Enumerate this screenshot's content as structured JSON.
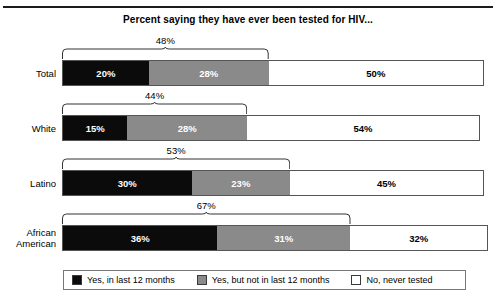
{
  "chart_data": {
    "type": "bar",
    "subtype": "stacked-horizontal-100pct",
    "title": "Percent saying they have ever been tested for HIV...",
    "xlabel": "",
    "ylabel": "",
    "xlim": [
      0,
      100
    ],
    "grid": false,
    "legend_position": "bottom",
    "categories": [
      "Total",
      "White",
      "Latino",
      "African American"
    ],
    "series": [
      {
        "name": "Yes, in last 12 months",
        "color": "#0b0b0b",
        "values": [
          20,
          15,
          30,
          36
        ]
      },
      {
        "name": "Yes, but not in last 12 months",
        "color": "#8a8a8a",
        "values": [
          28,
          28,
          23,
          31
        ]
      },
      {
        "name": "No, never tested",
        "color": "#ffffff",
        "values": [
          50,
          54,
          45,
          32
        ]
      }
    ],
    "annotations": [
      {
        "category": "Total",
        "label": "48%",
        "spans": [
          "Yes, in last 12 months",
          "Yes, but not in last 12 months"
        ]
      },
      {
        "category": "White",
        "label": "44%",
        "spans": [
          "Yes, in last 12 months",
          "Yes, but not in last 12 months"
        ]
      },
      {
        "category": "Latino",
        "label": "53%",
        "spans": [
          "Yes, in last 12 months",
          "Yes, but not in last 12 months"
        ]
      },
      {
        "category": "African American",
        "label": "67%",
        "spans": [
          "Yes, in last 12 months",
          "Yes, but not in last 12 months"
        ]
      }
    ]
  },
  "rows": [
    {
      "label_line1": "Total",
      "label_line2": "",
      "brace": "48%",
      "segments": [
        {
          "value": "20%",
          "pct": 20
        },
        {
          "value": "28%",
          "pct": 28
        },
        {
          "value": "50%",
          "pct": 50
        }
      ]
    },
    {
      "label_line1": "White",
      "label_line2": "",
      "brace": "44%",
      "segments": [
        {
          "value": "15%",
          "pct": 15
        },
        {
          "value": "28%",
          "pct": 28
        },
        {
          "value": "54%",
          "pct": 54
        }
      ]
    },
    {
      "label_line1": "Latino",
      "label_line2": "",
      "brace": "53%",
      "segments": [
        {
          "value": "30%",
          "pct": 30
        },
        {
          "value": "23%",
          "pct": 23
        },
        {
          "value": "45%",
          "pct": 45
        }
      ]
    },
    {
      "label_line1": "African",
      "label_line2": "American",
      "brace": "67%",
      "segments": [
        {
          "value": "36%",
          "pct": 36
        },
        {
          "value": "31%",
          "pct": 31
        },
        {
          "value": "32%",
          "pct": 32
        }
      ]
    }
  ],
  "legend": {
    "items": [
      {
        "label": "Yes, in last 12 months",
        "swatch": "black"
      },
      {
        "label": "Yes, but not in last 12 months",
        "swatch": "gray"
      },
      {
        "label": "No, never tested",
        "swatch": "white"
      }
    ]
  },
  "colors": {
    "yes_last_12": "#0b0b0b",
    "yes_not_last_12": "#8a8a8a",
    "never_tested": "#ffffff",
    "outline": "#555555"
  }
}
